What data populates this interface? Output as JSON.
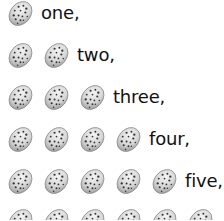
{
  "rows": [
    {
      "count": 1,
      "label": "one,"
    },
    {
      "count": 2,
      "label": "two,"
    },
    {
      "count": 3,
      "label": "three,"
    },
    {
      "count": 4,
      "label": "four,"
    },
    {
      "count": 5,
      "label": "five,"
    },
    {
      "count": 6,
      "label": ""
    }
  ],
  "icon": "cookie-icon",
  "colors": {
    "cookie_fill": "#d9d9d9",
    "cookie_edge": "#8a8a8a",
    "chip": "#333333",
    "text": "#111111"
  }
}
